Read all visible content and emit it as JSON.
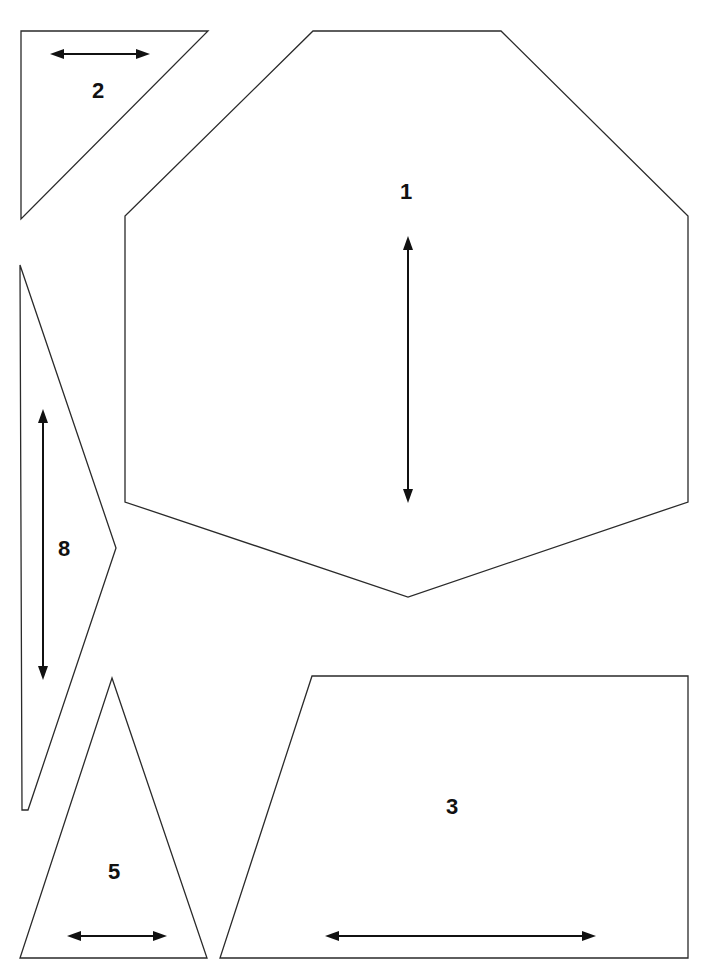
{
  "page": {
    "width": 717,
    "height": 976,
    "background": "#ffffff",
    "line_color": "#2a2a2a",
    "arrow_color": "#111111"
  },
  "pieces": [
    {
      "id": "piece-1",
      "label": "1",
      "shape": "octagon",
      "points": "313,31 501,31 688,216 688,502 408,597 125,502 125,216",
      "label_pos": [
        406,
        192
      ],
      "grain_arrow": {
        "orientation": "vertical",
        "x1": 408,
        "y1": 236,
        "x2": 408,
        "y2": 503
      }
    },
    {
      "id": "piece-2",
      "label": "2",
      "shape": "right-triangle",
      "points": "21,31 208,31 21,219",
      "label_pos": [
        98,
        91
      ],
      "grain_arrow": {
        "orientation": "horizontal",
        "x1": 50,
        "y1": 54,
        "x2": 150,
        "y2": 54
      }
    },
    {
      "id": "piece-8",
      "label": "8",
      "shape": "narrow-triangle",
      "points": "20,265 116,548 28,810 22,810",
      "label_pos": [
        64,
        549
      ],
      "grain_arrow": {
        "orientation": "vertical",
        "x1": 43,
        "y1": 409,
        "x2": 43,
        "y2": 680
      }
    },
    {
      "id": "piece-5",
      "label": "5",
      "shape": "isosceles-triangle",
      "points": "112,678 207,958 20,958",
      "label_pos": [
        114,
        872
      ],
      "grain_arrow": {
        "orientation": "horizontal",
        "x1": 67,
        "y1": 936,
        "x2": 167,
        "y2": 936
      }
    },
    {
      "id": "piece-3",
      "label": "3",
      "shape": "trapezoid",
      "points": "312,676 688,676 688,958 220,958",
      "label_pos": [
        452,
        807
      ],
      "grain_arrow": {
        "orientation": "horizontal",
        "x1": 325,
        "y1": 936,
        "x2": 596,
        "y2": 936
      }
    }
  ]
}
